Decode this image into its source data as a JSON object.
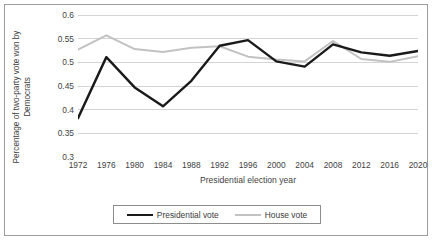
{
  "chart_data": {
    "type": "line",
    "title": "",
    "xlabel": "Presidential election year",
    "ylabel": "Percentage of two-party vote won by Democrats",
    "ylabel_lines": [
      "Percentage of two-party vote won by",
      "Democrats"
    ],
    "categories": [
      1972,
      1976,
      1980,
      1984,
      1988,
      1992,
      1996,
      2000,
      2004,
      2008,
      2012,
      2016,
      2020
    ],
    "xtick_labels": [
      "1972",
      "1976",
      "1980",
      "1984",
      "1988",
      "1992",
      "1996",
      "2000",
      "2004",
      "2008",
      "2012",
      "2016",
      "2020"
    ],
    "ytick_labels": [
      "0.6",
      "0.55",
      "0.5",
      "0.45",
      "0.4",
      "0.35",
      "0.3"
    ],
    "ytick_values": [
      0.6,
      0.55,
      0.5,
      0.45,
      0.4,
      0.35,
      0.3
    ],
    "ylim": [
      0.3,
      0.6
    ],
    "grid": "horizontal",
    "legend_position": "bottom",
    "series": [
      {
        "name": "Presidential vote",
        "color": "#1a1a1a",
        "values": [
          0.382,
          0.511,
          0.447,
          0.407,
          0.461,
          0.535,
          0.547,
          0.502,
          0.491,
          0.538,
          0.521,
          0.514,
          0.524
        ]
      },
      {
        "name": "House vote",
        "color": "#c2c2c2",
        "values": [
          0.527,
          0.557,
          0.528,
          0.522,
          0.531,
          0.534,
          0.512,
          0.506,
          0.502,
          0.545,
          0.507,
          0.501,
          0.513
        ]
      }
    ]
  },
  "legend": {
    "entries": [
      {
        "label": "Presidential vote"
      },
      {
        "label": "House vote"
      }
    ]
  }
}
